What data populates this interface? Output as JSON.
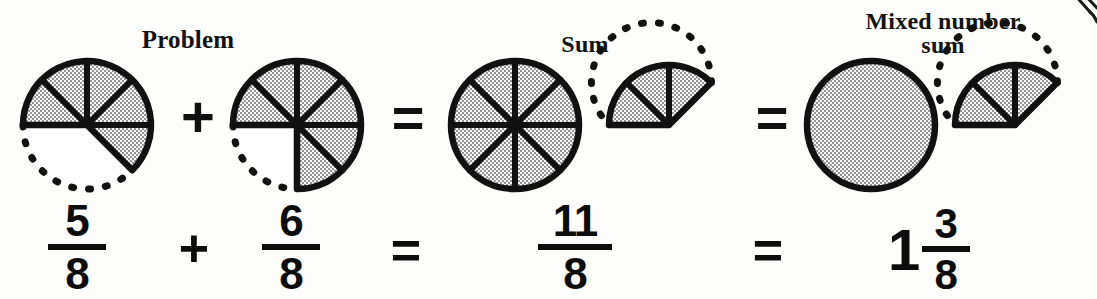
{
  "page": {
    "background_color": "#fdfdfb",
    "ink_color": "#101010",
    "shade_color": "#b7b7b7"
  },
  "headings": {
    "problem": "Problem",
    "sum": "Sum",
    "mixed_number_sum": "Mixed number\nsum"
  },
  "operators": {
    "plus": "+",
    "equals": "="
  },
  "top_row": {
    "figures": [
      {
        "name": "fraction-circle-5-8",
        "label": "5/8",
        "numerator": 5,
        "denominator": 8,
        "divisions": 8,
        "shaded_wedges": 5,
        "start_angle_deg": 180,
        "sweep_dir": "clockwise",
        "dashed_remainder": true,
        "radius": 64
      },
      {
        "name": "fraction-circle-6-8",
        "label": "6/8",
        "numerator": 6,
        "denominator": 8,
        "divisions": 8,
        "shaded_wedges": 6,
        "start_angle_deg": 180,
        "sweep_dir": "clockwise",
        "dashed_remainder": true,
        "radius": 64
      },
      {
        "name": "fraction-circle-8-8",
        "label": "8/8",
        "numerator": 8,
        "denominator": 8,
        "divisions": 8,
        "shaded_wedges": 8,
        "start_angle_deg": 180,
        "sweep_dir": "clockwise",
        "dashed_remainder": false,
        "radius": 64
      },
      {
        "name": "fraction-circle-3-8",
        "label": "3/8",
        "numerator": 3,
        "denominator": 8,
        "divisions": 8,
        "shaded_wedges": 3,
        "start_angle_deg": 180,
        "sweep_dir": "clockwise",
        "dashed_remainder": true,
        "radius": 60
      },
      {
        "name": "fraction-circle-whole",
        "label": "1 whole",
        "numerator": 1,
        "denominator": 1,
        "divisions": 1,
        "shaded_wedges": 1,
        "start_angle_deg": 180,
        "sweep_dir": "clockwise",
        "dashed_remainder": false,
        "radius": 64
      },
      {
        "name": "fraction-circle-3-8-mixed",
        "label": "3/8",
        "numerator": 3,
        "denominator": 8,
        "divisions": 8,
        "shaded_wedges": 3,
        "start_angle_deg": 180,
        "sweep_dir": "clockwise",
        "dashed_remainder": true,
        "radius": 60
      }
    ]
  },
  "bottom_row": {
    "terms": [
      {
        "name": "fraction-5-8",
        "numerator": "5",
        "denominator": "8"
      },
      {
        "name": "fraction-6-8",
        "numerator": "6",
        "denominator": "8"
      },
      {
        "name": "fraction-11-8",
        "numerator": "11",
        "denominator": "8"
      }
    ],
    "mixed_number": {
      "whole": "1",
      "numerator": "3",
      "denominator": "8"
    },
    "plus": "+",
    "equals": "="
  },
  "equation": {
    "expression": "5/8 + 6/8 = 11/8 = 1 3/8",
    "lhs_terms": [
      "5/8",
      "6/8"
    ],
    "improper_sum": "11/8",
    "mixed_sum": "1 3/8"
  }
}
